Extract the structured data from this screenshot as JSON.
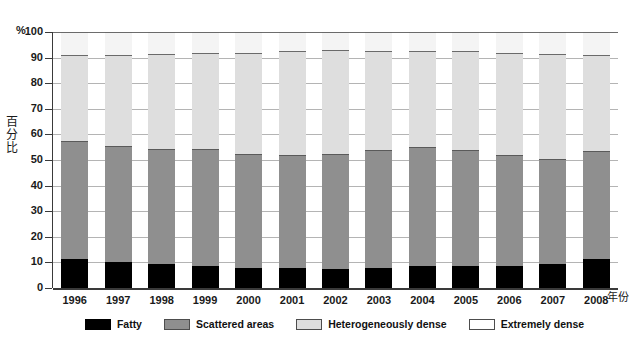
{
  "chart_data": {
    "type": "bar",
    "subtype": "stacked-bar-100",
    "title": "",
    "xlabel": "年份",
    "ylabel": "百分比",
    "unit_symbol": "%",
    "ylim": [
      0,
      100
    ],
    "yticks": [
      0,
      10,
      20,
      30,
      40,
      50,
      60,
      70,
      80,
      90,
      100
    ],
    "grid": true,
    "legend_position": "bottom-center",
    "categories": [
      "1996",
      "1997",
      "1998",
      "1999",
      "2000",
      "2001",
      "2002",
      "2003",
      "2004",
      "2005",
      "2006",
      "2007",
      "2008"
    ],
    "series": [
      {
        "name": "Fatty",
        "color": "#000000",
        "values": [
          11.5,
          10.0,
          9.5,
          8.5,
          8.0,
          8.0,
          7.5,
          8.0,
          8.5,
          8.5,
          8.5,
          9.5,
          11.5
        ]
      },
      {
        "name": "Scattered areas",
        "color": "#8f8f8f",
        "values": [
          46.0,
          45.5,
          45.0,
          46.0,
          44.5,
          44.0,
          45.0,
          46.0,
          46.5,
          45.5,
          43.5,
          41.0,
          42.0
        ]
      },
      {
        "name": "Heterogeneously dense",
        "color": "#dedede",
        "values": [
          33.5,
          35.5,
          37.0,
          37.5,
          39.5,
          40.5,
          40.5,
          38.5,
          37.5,
          38.5,
          40.0,
          41.0,
          37.5
        ]
      },
      {
        "name": "Extremely dense",
        "color": "#ffffff",
        "values": [
          9.0,
          9.0,
          8.5,
          8.0,
          8.0,
          7.5,
          7.0,
          7.5,
          7.5,
          7.5,
          8.0,
          8.5,
          9.0
        ]
      }
    ],
    "cumulative_tops": {
      "fatty": [
        11.5,
        10.0,
        9.5,
        8.5,
        8.0,
        8.0,
        7.5,
        8.0,
        8.5,
        8.5,
        8.5,
        9.5,
        11.5
      ],
      "scattered": [
        57.5,
        55.5,
        54.5,
        54.5,
        52.5,
        52.0,
        52.5,
        54.0,
        55.0,
        54.0,
        52.0,
        50.5,
        53.5
      ],
      "hetero": [
        91.0,
        91.0,
        91.5,
        92.0,
        92.0,
        92.5,
        93.0,
        92.5,
        92.5,
        92.5,
        92.0,
        91.5,
        91.0
      ],
      "extreme": [
        100,
        100,
        100,
        100,
        100,
        100,
        100,
        100,
        100,
        100,
        100,
        100,
        100
      ]
    }
  },
  "legend": {
    "items": [
      {
        "label": "Fatty",
        "swatch": "fatty-swatch"
      },
      {
        "label": "Scattered areas",
        "swatch": "scattered-swatch"
      },
      {
        "label": "Heterogeneously dense",
        "swatch": "hetero-swatch"
      },
      {
        "label": "Extremely dense",
        "swatch": "extreme-swatch"
      }
    ]
  }
}
